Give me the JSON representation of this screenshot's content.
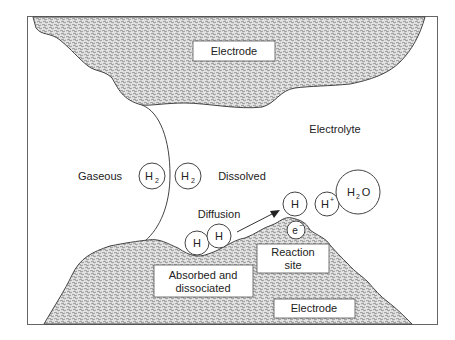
{
  "diagram": {
    "regions": {
      "top_electrode_label": "Electrode",
      "bottom_electrode_label": "Electrode",
      "electrolyte_label": "Electrolyte",
      "gaseous_label": "Gaseous",
      "dissolved_label": "Dissolved",
      "diffusion_label": "Diffusion",
      "reaction_site_label_line1": "Reaction",
      "reaction_site_label_line2": "site",
      "absorbed_label_line1": "Absorbed and",
      "absorbed_label_line2": "dissociated"
    },
    "species": {
      "h2_gas": {
        "symbol": "H",
        "sub": "2"
      },
      "h2_dissolved": {
        "symbol": "H",
        "sub": "2"
      },
      "h_adsorbed_1": {
        "symbol": "H"
      },
      "h_adsorbed_2": {
        "symbol": "H"
      },
      "h_reaction": {
        "symbol": "H"
      },
      "h_plus": {
        "symbol": "H",
        "sup": "+"
      },
      "water": {
        "symbol_a": "H",
        "sub": "2",
        "symbol_b": "O"
      },
      "electron": {
        "symbol": "e",
        "sup": "−"
      }
    },
    "colors": {
      "frame": "#666666",
      "outline": "#444444",
      "stipple_fg": "#8a8a8a",
      "stipple_bg": "#e6e6e6",
      "text": "#222222"
    }
  }
}
